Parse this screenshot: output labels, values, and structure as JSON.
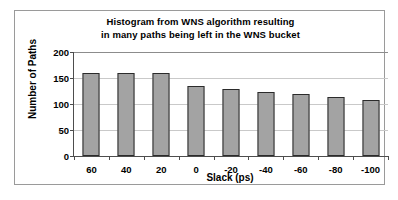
{
  "chart_data": {
    "type": "bar",
    "title": "Histogram from WNS algorithm resulting in many paths being left in the WNS bucket",
    "title_lines": [
      "Histogram from WNS algorithm resulting",
      "in many paths being left in the WNS bucket"
    ],
    "xlabel": "Slack (ps)",
    "ylabel": "Number of Paths",
    "categories": [
      "60",
      "40",
      "20",
      "0",
      "-20",
      "-40",
      "-60",
      "-80",
      "-100"
    ],
    "values": [
      160,
      159,
      159,
      134,
      129,
      124,
      119,
      114,
      108
    ],
    "ylim": [
      0,
      200
    ],
    "yticks": [
      "0",
      "50",
      "100",
      "150",
      "200"
    ],
    "ytick_values": [
      0,
      50,
      100,
      150,
      200
    ],
    "grid": "horizontal",
    "legend": "none",
    "colors": {
      "bar_fill": "#a3a3a3",
      "bar_border": "#2b2b2b",
      "gridline": "#c9c9c9",
      "axis": "#4d4d4d",
      "frame": "#9a9a9a",
      "text": "#000000",
      "background": "#ffffff"
    }
  }
}
